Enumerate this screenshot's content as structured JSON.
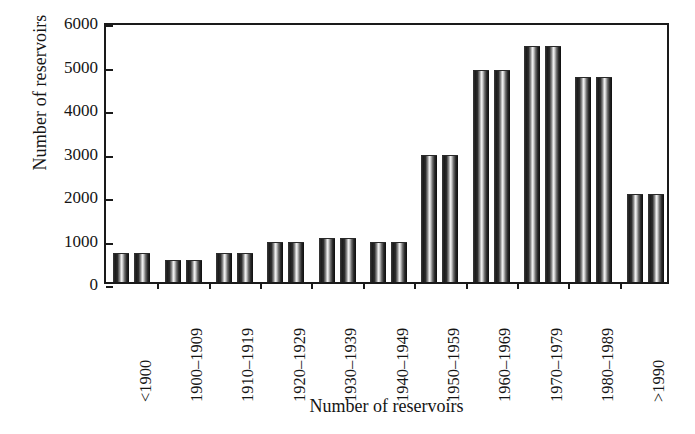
{
  "chart_data": {
    "type": "bar",
    "title": "",
    "xlabel": "Number of reservoirs",
    "ylabel": "Number of reservoirs",
    "categories": [
      "<1900",
      "1900–1909",
      "1910–1919",
      "1920–1929",
      "1930–1939",
      "1940–1949",
      "1950–1959",
      "1960–1969",
      "1970–1979",
      "1980–1989",
      ">1990"
    ],
    "series": [
      {
        "name": "series-a",
        "values": [
          650,
          480,
          650,
          900,
          1000,
          900,
          2900,
          4850,
          5400,
          4700,
          2000
        ]
      },
      {
        "name": "series-b",
        "values": [
          650,
          480,
          650,
          900,
          1000,
          900,
          2900,
          4850,
          5400,
          4700,
          2000
        ]
      }
    ],
    "values": [
      650,
      480,
      650,
      900,
      1000,
      900,
      2900,
      4850,
      5400,
      4700,
      2000
    ],
    "ylim": [
      0,
      6000
    ],
    "yticks": [
      0,
      1000,
      2000,
      3000,
      4000,
      5000,
      6000
    ],
    "ytick_labels": [
      "0",
      "1000",
      "2000",
      "3000",
      "4000",
      "5000",
      "6000"
    ],
    "grid": false,
    "legend": "none",
    "bar_style": "cylinder-gradient",
    "frame": "full-box",
    "colors": {
      "bar_dark": "#1b1b1b",
      "bar_highlight": "#f2f2f2",
      "axis": "#1a1a1a",
      "text": "#151515",
      "background": "#ffffff"
    }
  }
}
